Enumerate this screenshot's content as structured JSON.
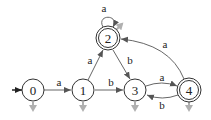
{
  "diagram": {
    "type": "finite-automaton",
    "states": [
      {
        "id": "0",
        "label": "0",
        "x": 33,
        "y": 90,
        "accepting": false,
        "initial": true
      },
      {
        "id": "1",
        "label": "1",
        "x": 83,
        "y": 90,
        "accepting": false,
        "initial": false
      },
      {
        "id": "2",
        "label": "2",
        "x": 108,
        "y": 38,
        "accepting": true,
        "initial": false
      },
      {
        "id": "3",
        "label": "3",
        "x": 135,
        "y": 90,
        "accepting": false,
        "initial": false
      },
      {
        "id": "4",
        "label": "4",
        "x": 189,
        "y": 90,
        "accepting": true,
        "initial": false
      }
    ],
    "transitions": [
      {
        "from": "0",
        "to": "1",
        "label": "a"
      },
      {
        "from": "1",
        "to": "2",
        "label": "a"
      },
      {
        "from": "1",
        "to": "3",
        "label": "b"
      },
      {
        "from": "2",
        "to": "2",
        "label": "a"
      },
      {
        "from": "2",
        "to": "3",
        "label": "b"
      },
      {
        "from": "3",
        "to": "4",
        "label": "a"
      },
      {
        "from": "4",
        "to": "3",
        "label": "b"
      },
      {
        "from": "4",
        "to": "2",
        "label": "a"
      }
    ],
    "colors": {
      "stroke": "#333333",
      "edge": "#555555",
      "gray_marker": "#b0b0b0"
    }
  }
}
